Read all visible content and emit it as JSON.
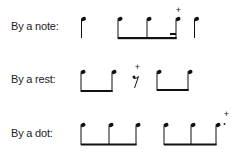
{
  "rows": [
    {
      "label": "By a note:",
      "notes": [
        {
          "x": 82,
          "plus": false
        },
        {
          "x": 118,
          "plus": false,
          "beam_group": 1
        },
        {
          "x": 147,
          "plus": false,
          "beam_group": 1
        },
        {
          "x": 176,
          "plus": true,
          "beam_group": 1,
          "partial_beam": true
        },
        {
          "x": 195,
          "plus": false
        }
      ]
    },
    {
      "label": "By a rest:",
      "notes": [
        {
          "x": 81,
          "beam_group": 1
        },
        {
          "x": 112,
          "beam_group": 1
        },
        {
          "x": 157,
          "beam_group": 2
        },
        {
          "x": 188,
          "beam_group": 2
        }
      ],
      "rest": {
        "x": 135,
        "plus": true
      }
    },
    {
      "label": "By a dot:",
      "notes": [
        {
          "x": 81,
          "beam_group": 1
        },
        {
          "x": 109,
          "beam_group": 1
        },
        {
          "x": 136,
          "beam_group": 1
        },
        {
          "x": 164,
          "beam_group": 2
        },
        {
          "x": 191,
          "beam_group": 2
        },
        {
          "x": 216,
          "beam_group": 2,
          "plus": true,
          "dot": true
        }
      ]
    }
  ],
  "symbols": {
    "plus": "+",
    "dot": "·"
  }
}
